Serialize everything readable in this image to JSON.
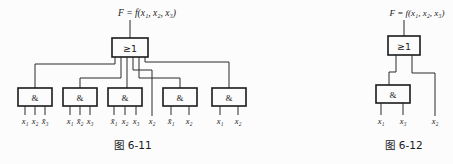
{
  "figure_left": {
    "formula": "F = f(x₁, x₂, x₃)",
    "or_gate_label": "≥1",
    "and_gate_label": "&",
    "input_labels": [
      "x₁",
      "x₂",
      "x̄₃",
      "x₁",
      "x̄₂",
      "x₃",
      "x̄₁",
      "x₂",
      "x₃",
      "x₂",
      "x̄₁",
      "x₂",
      "x₁",
      "x₂"
    ],
    "caption": "图 6-11"
  },
  "figure_right": {
    "formula": "F = f(x₁, x₂, x₃)",
    "or_gate_label": "≥1",
    "and_gate_label": "&",
    "input_labels": [
      "x₁",
      "x₃",
      "x₂"
    ],
    "caption": "图 6-12"
  },
  "colors": {
    "line": "#2a2a2a",
    "background": "#fcfcfc"
  }
}
